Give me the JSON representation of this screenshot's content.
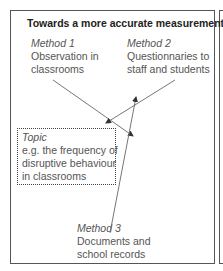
{
  "title": "Towards a more accurate measurement",
  "methods": [
    {
      "heading": "Method 1",
      "lines": [
        "Observation in",
        "classrooms"
      ]
    },
    {
      "heading": "Method 2",
      "lines": [
        "Questionnaries to",
        "staff and students"
      ]
    },
    {
      "heading": "Method 3",
      "lines": [
        "Documents and",
        "school records"
      ]
    }
  ],
  "topic": {
    "heading": "Topic",
    "lines": [
      "e.g. the frequency of",
      "disruptive behaviour",
      "in classrooms"
    ]
  },
  "colors": {
    "border": "#555555",
    "text": "#555555",
    "title": "#222222",
    "arrow": "#555555"
  }
}
